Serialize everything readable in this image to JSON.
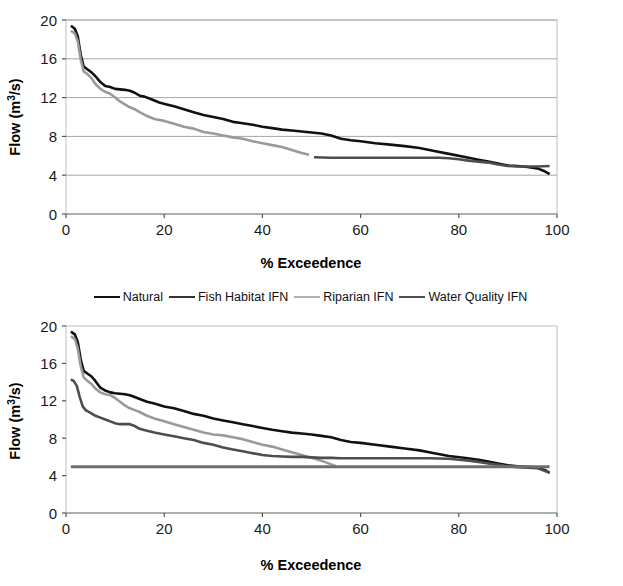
{
  "figure": {
    "background": "#ffffff",
    "series_colors": {
      "natural": "#111111",
      "fish_habitat_ifn": "#4d4d4d",
      "riparian_ifn": "#9a9a9a",
      "water_quality_ifn": "#6e6e6e"
    },
    "grid_color": "#a6a6a6",
    "frame_color": "#bfbfbf"
  },
  "legend": {
    "position": "between-charts",
    "items": [
      {
        "label": "Natural",
        "color": "#111111",
        "icon": "line-swatch-icon"
      },
      {
        "label": "Fish Habitat IFN",
        "color": "#333333",
        "icon": "line-swatch-icon"
      },
      {
        "label": "Riparian IFN",
        "color": "#b0b0b0",
        "icon": "line-swatch-icon"
      },
      {
        "label": "Water Quality IFN",
        "color": "#4d4d4d",
        "icon": "line-swatch-icon"
      }
    ]
  },
  "chart_data": [
    {
      "id": "top-chart",
      "type": "line",
      "title": "",
      "xlabel": "% Exceedence",
      "ylabel": "Flow (m3/s)",
      "ylabel_base": "Flow (m",
      "ylabel_sup": "3",
      "ylabel_tail": "/s)",
      "xlim": [
        0,
        100
      ],
      "ylim": [
        0,
        20
      ],
      "xticks": [
        0,
        20,
        40,
        60,
        80,
        100
      ],
      "yticks": [
        0,
        4,
        8,
        12,
        16,
        20
      ],
      "xtick_labels": [
        "0",
        "20",
        "40",
        "60",
        "80",
        "100"
      ],
      "ytick_labels": [
        "0",
        "4",
        "8",
        "12",
        "16",
        "20"
      ],
      "grid": "horizontal",
      "legend_shown": false,
      "series": [
        {
          "name": "Natural",
          "color": "#111111",
          "width": 2.6,
          "x": [
            1.0,
            1.8,
            2.4,
            3.0,
            3.6,
            4.4,
            5.2,
            6.0,
            7.0,
            8.0,
            9.0,
            10.0,
            11.0,
            12.0,
            13.0,
            14.0,
            15.0,
            16.0,
            17.5,
            19.0,
            20.5,
            22.0,
            24.0,
            26.0,
            28.0,
            30.0,
            32.0,
            34.0,
            36.0,
            38.0,
            40.0,
            42.0,
            44.0,
            46.0,
            48.0,
            50.0,
            52.0,
            54.0,
            56.0,
            58.0,
            60.0,
            63.0,
            66.0,
            69.0,
            72.0,
            75.0,
            78.0,
            81.0,
            84.0,
            86.0,
            88.0,
            90.0,
            92.0,
            94.0,
            96.0,
            97.5,
            98.5
          ],
          "y": [
            19.4,
            19.1,
            18.3,
            16.4,
            15.2,
            14.9,
            14.6,
            14.2,
            13.6,
            13.2,
            13.1,
            12.9,
            12.85,
            12.8,
            12.7,
            12.5,
            12.2,
            12.1,
            11.8,
            11.5,
            11.3,
            11.1,
            10.8,
            10.5,
            10.2,
            10.0,
            9.8,
            9.5,
            9.35,
            9.2,
            9.0,
            8.85,
            8.7,
            8.6,
            8.5,
            8.4,
            8.3,
            8.1,
            7.75,
            7.6,
            7.5,
            7.3,
            7.15,
            7.0,
            6.8,
            6.5,
            6.2,
            5.9,
            5.6,
            5.4,
            5.2,
            5.0,
            4.95,
            4.85,
            4.7,
            4.4,
            4.1
          ]
        },
        {
          "name": "Riparian IFN",
          "color": "#9a9a9a",
          "width": 2.6,
          "x": [
            1.0,
            1.8,
            2.4,
            3.0,
            3.6,
            4.4,
            5.2,
            6.0,
            7.0,
            8.0,
            9.0,
            10.0,
            11.0,
            12.0,
            13.0,
            14.0,
            15.0,
            16.5,
            18.0,
            20.0,
            22.0,
            24.0,
            26.0,
            28.0,
            30.0,
            32.0,
            34.0,
            36.0,
            38.0,
            40.0,
            42.0,
            44.0,
            46.0,
            48.0,
            49.5
          ],
          "y": [
            18.9,
            18.6,
            17.8,
            15.9,
            14.7,
            14.4,
            14.0,
            13.4,
            12.9,
            12.6,
            12.4,
            12.0,
            11.6,
            11.3,
            11.0,
            10.8,
            10.5,
            10.1,
            9.8,
            9.6,
            9.3,
            9.0,
            8.8,
            8.45,
            8.3,
            8.1,
            7.9,
            7.75,
            7.5,
            7.3,
            7.1,
            6.9,
            6.6,
            6.3,
            6.1
          ]
        },
        {
          "name": "Fish Habitat IFN",
          "color": "#4d4d4d",
          "width": 2.6,
          "x": [
            50.5,
            54.0,
            58.0,
            62.0,
            66.0,
            70.0,
            74.0,
            76.0,
            78.0,
            80.0,
            82.0,
            84.0,
            86.0,
            88.0,
            90.0,
            92.0,
            94.0,
            96.0,
            98.5
          ],
          "y": [
            5.85,
            5.8,
            5.8,
            5.8,
            5.8,
            5.8,
            5.8,
            5.8,
            5.75,
            5.65,
            5.5,
            5.4,
            5.3,
            5.1,
            4.95,
            4.9,
            4.9,
            4.9,
            4.95
          ]
        }
      ]
    },
    {
      "id": "bottom-chart",
      "type": "line",
      "title": "",
      "xlabel": "% Exceedence",
      "ylabel": "Flow (m3/s)",
      "ylabel_base": "Flow (m",
      "ylabel_sup": "3",
      "ylabel_tail": "/s)",
      "xlim": [
        0,
        100
      ],
      "ylim": [
        0,
        20
      ],
      "xticks": [
        0,
        20,
        40,
        60,
        80,
        100
      ],
      "yticks": [
        0,
        4,
        8,
        12,
        16,
        20
      ],
      "xtick_labels": [
        "0",
        "20",
        "40",
        "60",
        "80",
        "100"
      ],
      "ytick_labels": [
        "0",
        "4",
        "8",
        "12",
        "16",
        "20"
      ],
      "grid": "none",
      "legend_shown": false,
      "series": [
        {
          "name": "Natural",
          "color": "#111111",
          "width": 2.6,
          "x": [
            1.0,
            1.8,
            2.4,
            3.0,
            3.6,
            4.4,
            5.2,
            6.0,
            7.0,
            8.0,
            9.0,
            10.0,
            11.0,
            12.0,
            13.0,
            14.0,
            15.0,
            16.5,
            18.0,
            20.0,
            22.0,
            24.0,
            26.0,
            28.0,
            30.0,
            32.0,
            34.0,
            36.0,
            38.0,
            40.0,
            42.0,
            44.0,
            46.0,
            48.0,
            50.0,
            52.0,
            54.0,
            56.0,
            58.0,
            60.0,
            63.0,
            66.0,
            69.0,
            72.0,
            75.0,
            78.0,
            81.0,
            84.0,
            86.0,
            88.0,
            90.0,
            92.0,
            94.0,
            96.0,
            97.5,
            98.5
          ],
          "y": [
            19.4,
            19.1,
            18.3,
            16.4,
            15.2,
            14.9,
            14.6,
            14.1,
            13.4,
            13.1,
            12.9,
            12.8,
            12.75,
            12.7,
            12.6,
            12.4,
            12.2,
            11.9,
            11.7,
            11.4,
            11.2,
            10.9,
            10.6,
            10.4,
            10.1,
            9.9,
            9.7,
            9.5,
            9.3,
            9.1,
            8.9,
            8.75,
            8.6,
            8.5,
            8.4,
            8.25,
            8.1,
            7.8,
            7.6,
            7.5,
            7.3,
            7.1,
            6.9,
            6.7,
            6.4,
            6.1,
            5.9,
            5.7,
            5.5,
            5.3,
            5.1,
            5.0,
            4.95,
            4.85,
            4.6,
            4.3
          ]
        },
        {
          "name": "Riparian IFN",
          "color": "#9a9a9a",
          "width": 2.6,
          "x": [
            1.0,
            1.8,
            2.4,
            3.0,
            3.6,
            4.4,
            5.2,
            6.0,
            7.0,
            8.0,
            9.0,
            10.0,
            11.0,
            12.0,
            13.0,
            14.0,
            15.0,
            16.5,
            18.0,
            20.0,
            22.0,
            24.0,
            26.0,
            28.0,
            30.0,
            32.0,
            34.0,
            36.0,
            38.0,
            40.0,
            42.0,
            44.0,
            46.0,
            48.0,
            50.0,
            52.0,
            54.0,
            55.0
          ],
          "y": [
            18.9,
            18.6,
            17.6,
            15.7,
            14.5,
            14.1,
            13.8,
            13.3,
            12.9,
            12.7,
            12.6,
            12.3,
            11.9,
            11.5,
            11.2,
            11.0,
            10.8,
            10.4,
            10.1,
            9.8,
            9.5,
            9.2,
            8.9,
            8.6,
            8.4,
            8.3,
            8.1,
            7.9,
            7.6,
            7.3,
            7.1,
            6.8,
            6.5,
            6.2,
            5.9,
            5.6,
            5.2,
            5.0
          ]
        },
        {
          "name": "Fish Habitat IFN",
          "color": "#4d4d4d",
          "width": 2.6,
          "x": [
            1.0,
            1.6,
            2.2,
            2.8,
            3.4,
            4.0,
            5.0,
            6.0,
            7.0,
            8.0,
            9.0,
            10.0,
            11.0,
            12.0,
            13.0,
            14.0,
            15.0,
            16.5,
            18.0,
            20.0,
            22.0,
            24.0,
            26.0,
            28.0,
            30.0,
            32.0,
            34.0,
            36.0,
            38.0,
            40.0,
            42.0,
            44.0,
            46.0,
            48.0,
            50.0,
            52.0,
            54.0,
            56.0,
            58.0,
            62.0,
            66.0,
            70.0,
            74.0,
            78.0,
            80.0,
            82.0,
            84.0,
            86.0,
            88.0,
            90.0,
            92.0,
            94.0,
            96.0,
            98.5
          ],
          "y": [
            14.3,
            14.1,
            13.6,
            12.4,
            11.4,
            11.0,
            10.7,
            10.4,
            10.2,
            10.0,
            9.8,
            9.6,
            9.5,
            9.5,
            9.5,
            9.3,
            9.0,
            8.8,
            8.6,
            8.4,
            8.2,
            8.0,
            7.8,
            7.5,
            7.3,
            7.0,
            6.8,
            6.6,
            6.4,
            6.2,
            6.1,
            6.05,
            6.0,
            6.0,
            5.95,
            5.9,
            5.9,
            5.85,
            5.85,
            5.85,
            5.85,
            5.85,
            5.85,
            5.8,
            5.7,
            5.6,
            5.45,
            5.3,
            5.15,
            5.0,
            4.9,
            4.85,
            4.8,
            4.3
          ]
        },
        {
          "name": "Water Quality IFN",
          "color": "#6e6e6e",
          "width": 3.0,
          "x": [
            1.0,
            98.5
          ],
          "y": [
            4.95,
            4.95
          ]
        }
      ]
    }
  ]
}
